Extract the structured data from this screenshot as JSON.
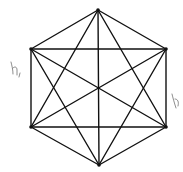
{
  "diagram": {
    "type": "complete-graph-hexagon",
    "vertices": [
      {
        "id": "top",
        "x": 98,
        "y": 10
      },
      {
        "id": "upper-right",
        "x": 166,
        "y": 49
      },
      {
        "id": "lower-right",
        "x": 166,
        "y": 127
      },
      {
        "id": "bottom",
        "x": 99,
        "y": 165
      },
      {
        "id": "lower-left",
        "x": 31,
        "y": 127
      },
      {
        "id": "upper-left",
        "x": 31,
        "y": 49
      }
    ],
    "annotations": [
      {
        "id": "left-mark",
        "text": "h,",
        "x": 10,
        "y": 70
      },
      {
        "id": "right-mark",
        "text": "b",
        "x": 172,
        "y": 100
      }
    ],
    "line_color": "#111111",
    "background": "#ffffff"
  }
}
